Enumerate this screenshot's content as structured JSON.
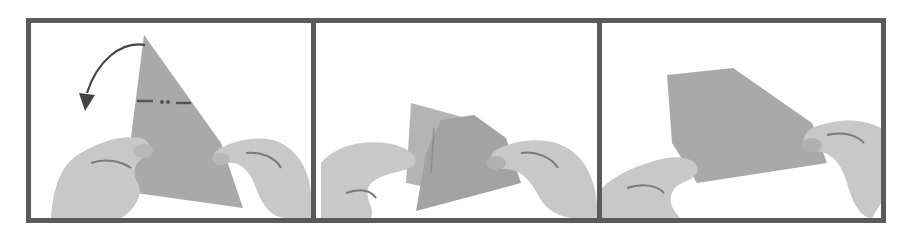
{
  "figure": {
    "colors": {
      "frame": "#5a5a5a",
      "paper": "#a9a9a9",
      "paper_dark": "#8f8f8f",
      "hand": "#c8c8c8",
      "hand_shadow": "#7a7a7a",
      "background": "#ffffff",
      "fold_line": "#555555",
      "arrow": "#444444"
    },
    "panels": [
      {
        "step": 1,
        "content": "Hands hold triangular paper; curved arrow indicates folding top point down-left along dashed fold line",
        "icons": [
          "curved-arrow-icon",
          "dash-dot-fold-line"
        ]
      },
      {
        "step": 2,
        "content": "Hands hold paper mid-fold, flap being tucked"
      },
      {
        "step": 3,
        "content": "Hands hold resulting trapezoid-shaped folded paper"
      }
    ]
  }
}
